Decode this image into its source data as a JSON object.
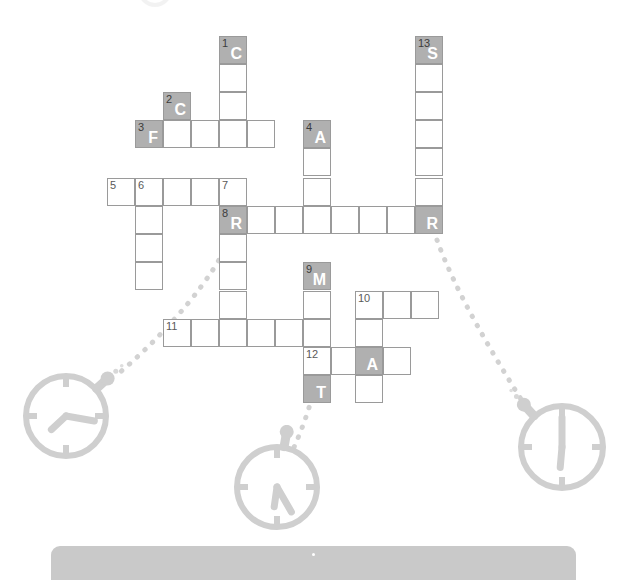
{
  "page": {
    "background_color": "#ffffff"
  },
  "colors": {
    "cell_fill": "#ffffff",
    "cell_border": "#9a9a9a",
    "shaded_fill": "#b0b0b0",
    "letter_color": "#ffffff",
    "number_color": "#5a5a5a",
    "icon_color": "#cfcfcf",
    "dot_color": "#d2d2d2",
    "bottom_bar": "#c9c9c9"
  },
  "grid": {
    "cell_size": 28,
    "cells": [
      {
        "id": "c1",
        "x": 219,
        "y": 36,
        "number": "1",
        "letter": "C",
        "shaded": true
      },
      {
        "id": "c1b",
        "x": 219,
        "y": 64,
        "number": "",
        "letter": "",
        "shaded": false
      },
      {
        "id": "c1c",
        "x": 219,
        "y": 92,
        "number": "",
        "letter": "",
        "shaded": false
      },
      {
        "id": "c13",
        "x": 415,
        "y": 36,
        "number": "13",
        "letter": "S",
        "shaded": true
      },
      {
        "id": "c13b",
        "x": 415,
        "y": 64,
        "number": "",
        "letter": "",
        "shaded": false
      },
      {
        "id": "c13c",
        "x": 415,
        "y": 92,
        "number": "",
        "letter": "",
        "shaded": false
      },
      {
        "id": "c13d",
        "x": 415,
        "y": 120,
        "number": "",
        "letter": "",
        "shaded": false
      },
      {
        "id": "c13e",
        "x": 415,
        "y": 148,
        "number": "",
        "letter": "",
        "shaded": false
      },
      {
        "id": "c13f",
        "x": 415,
        "y": 178,
        "number": "",
        "letter": "",
        "shaded": false
      },
      {
        "id": "c2",
        "x": 163,
        "y": 92,
        "number": "2",
        "letter": "C",
        "shaded": true
      },
      {
        "id": "c3",
        "x": 135,
        "y": 120,
        "number": "3",
        "letter": "F",
        "shaded": true
      },
      {
        "id": "c3b",
        "x": 163,
        "y": 120,
        "number": "",
        "letter": "",
        "shaded": false
      },
      {
        "id": "c3c",
        "x": 191,
        "y": 120,
        "number": "",
        "letter": "",
        "shaded": false
      },
      {
        "id": "c3d",
        "x": 219,
        "y": 120,
        "number": "",
        "letter": "",
        "shaded": false
      },
      {
        "id": "c3e",
        "x": 247,
        "y": 120,
        "number": "",
        "letter": "",
        "shaded": false
      },
      {
        "id": "c4",
        "x": 303,
        "y": 120,
        "number": "4",
        "letter": "A",
        "shaded": true
      },
      {
        "id": "c4b",
        "x": 303,
        "y": 148,
        "number": "",
        "letter": "",
        "shaded": false
      },
      {
        "id": "c4c",
        "x": 303,
        "y": 178,
        "number": "",
        "letter": "",
        "shaded": false
      },
      {
        "id": "c5",
        "x": 107,
        "y": 178,
        "number": "5",
        "letter": "",
        "shaded": false
      },
      {
        "id": "c6",
        "x": 135,
        "y": 178,
        "number": "6",
        "letter": "",
        "shaded": false
      },
      {
        "id": "c5c",
        "x": 163,
        "y": 178,
        "number": "",
        "letter": "",
        "shaded": false
      },
      {
        "id": "c5d",
        "x": 191,
        "y": 178,
        "number": "",
        "letter": "",
        "shaded": false
      },
      {
        "id": "c7",
        "x": 219,
        "y": 178,
        "number": "7",
        "letter": "",
        "shaded": false
      },
      {
        "id": "c6b",
        "x": 135,
        "y": 206,
        "number": "",
        "letter": "",
        "shaded": false
      },
      {
        "id": "c6c",
        "x": 135,
        "y": 234,
        "number": "",
        "letter": "",
        "shaded": false
      },
      {
        "id": "c6d",
        "x": 135,
        "y": 262,
        "number": "",
        "letter": "",
        "shaded": false
      },
      {
        "id": "c8",
        "x": 219,
        "y": 206,
        "number": "8",
        "letter": "R",
        "shaded": true
      },
      {
        "id": "c8b",
        "x": 247,
        "y": 206,
        "number": "",
        "letter": "",
        "shaded": false
      },
      {
        "id": "c8c",
        "x": 275,
        "y": 206,
        "number": "",
        "letter": "",
        "shaded": false
      },
      {
        "id": "c8d",
        "x": 303,
        "y": 206,
        "number": "",
        "letter": "",
        "shaded": false
      },
      {
        "id": "c8e",
        "x": 331,
        "y": 206,
        "number": "",
        "letter": "",
        "shaded": false
      },
      {
        "id": "c8f",
        "x": 359,
        "y": 206,
        "number": "",
        "letter": "",
        "shaded": false
      },
      {
        "id": "c8g",
        "x": 387,
        "y": 206,
        "number": "",
        "letter": "",
        "shaded": false
      },
      {
        "id": "c8h",
        "x": 415,
        "y": 206,
        "number": "",
        "letter": "R",
        "shaded": true
      },
      {
        "id": "c7b",
        "x": 219,
        "y": 234,
        "number": "",
        "letter": "",
        "shaded": false
      },
      {
        "id": "c7c",
        "x": 219,
        "y": 262,
        "number": "",
        "letter": "",
        "shaded": false
      },
      {
        "id": "c7d",
        "x": 219,
        "y": 291,
        "number": "",
        "letter": "",
        "shaded": false
      },
      {
        "id": "c9",
        "x": 303,
        "y": 262,
        "number": "9",
        "letter": "M",
        "shaded": true
      },
      {
        "id": "c9b",
        "x": 303,
        "y": 291,
        "number": "",
        "letter": "",
        "shaded": false
      },
      {
        "id": "c10",
        "x": 355,
        "y": 291,
        "number": "10",
        "letter": "",
        "shaded": false
      },
      {
        "id": "c10b",
        "x": 383,
        "y": 291,
        "number": "",
        "letter": "",
        "shaded": false
      },
      {
        "id": "c10c",
        "x": 411,
        "y": 291,
        "number": "",
        "letter": "",
        "shaded": false
      },
      {
        "id": "c11",
        "x": 163,
        "y": 319,
        "number": "11",
        "letter": "",
        "shaded": false
      },
      {
        "id": "c11b",
        "x": 191,
        "y": 319,
        "number": "",
        "letter": "",
        "shaded": false
      },
      {
        "id": "c11c",
        "x": 219,
        "y": 319,
        "number": "",
        "letter": "",
        "shaded": false
      },
      {
        "id": "c11d",
        "x": 247,
        "y": 319,
        "number": "",
        "letter": "",
        "shaded": false
      },
      {
        "id": "c11e",
        "x": 275,
        "y": 319,
        "number": "",
        "letter": "",
        "shaded": false
      },
      {
        "id": "c11f",
        "x": 303,
        "y": 319,
        "number": "",
        "letter": "",
        "shaded": false
      },
      {
        "id": "c11g",
        "x": 355,
        "y": 319,
        "number": "",
        "letter": "",
        "shaded": false
      },
      {
        "id": "c12",
        "x": 303,
        "y": 347,
        "number": "12",
        "letter": "",
        "shaded": false
      },
      {
        "id": "c12b",
        "x": 331,
        "y": 347,
        "number": "",
        "letter": "",
        "shaded": false
      },
      {
        "id": "c12c",
        "x": 355,
        "y": 347,
        "number": "",
        "letter": "A",
        "shaded": true
      },
      {
        "id": "c12d",
        "x": 383,
        "y": 347,
        "number": "",
        "letter": "",
        "shaded": false
      },
      {
        "id": "c12t",
        "x": 303,
        "y": 375,
        "number": "",
        "letter": "T",
        "shaded": true
      },
      {
        "id": "c10d",
        "x": 355,
        "y": 375,
        "number": "",
        "letter": "",
        "shaded": false
      }
    ]
  },
  "clocks": [
    {
      "id": "clock-left",
      "cx": 66,
      "cy": 416,
      "r": 40,
      "hour_angle": 227,
      "minute_angle": 100,
      "crown_angle": 48,
      "label": "stopwatch-icon-left"
    },
    {
      "id": "clock-center",
      "cx": 277,
      "cy": 487,
      "r": 40,
      "hour_angle": 188,
      "minute_angle": 150,
      "crown_angle": 10,
      "label": "stopwatch-icon-center"
    },
    {
      "id": "clock-right",
      "cx": 562,
      "cy": 447,
      "r": 41,
      "hour_angle": 185,
      "minute_angle": 0,
      "crown_angle": -42,
      "label": "stopwatch-icon-right"
    }
  ],
  "bottom_bar": {
    "label": "",
    "dot": ""
  }
}
